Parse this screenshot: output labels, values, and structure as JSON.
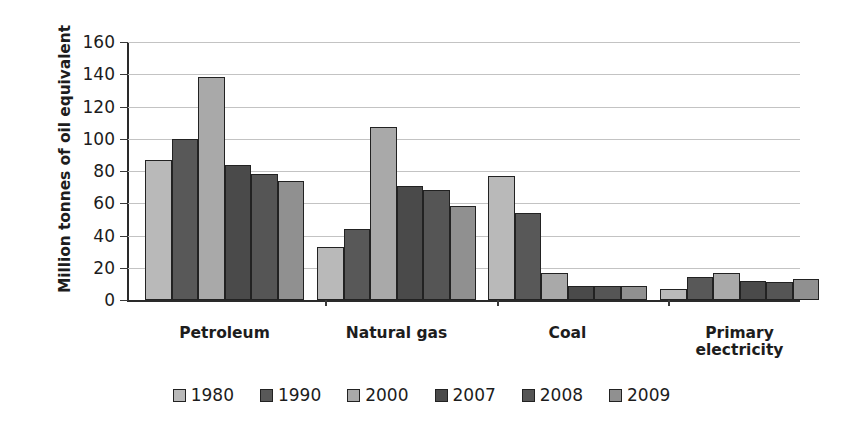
{
  "chart_data": {
    "type": "bar",
    "title": "",
    "xlabel": "",
    "ylabel": "Million tonnes of oil equivalent",
    "ylim": [
      0,
      160
    ],
    "yticks": [
      0,
      20,
      40,
      60,
      80,
      100,
      120,
      140,
      160
    ],
    "ytick_labels": [
      "0",
      "20",
      "40",
      "60",
      "80",
      "100",
      "120",
      "140",
      "160"
    ],
    "grid": true,
    "legend_position": "bottom",
    "categories": [
      "Petroleum",
      "Natural gas",
      "Coal",
      "Primary\nelectricity"
    ],
    "series": [
      {
        "name": "1980",
        "color": "#b9b9b9",
        "values": [
          87,
          33,
          77,
          7
        ]
      },
      {
        "name": "1990",
        "color": "#585858",
        "values": [
          100,
          44,
          54,
          14
        ]
      },
      {
        "name": "2000",
        "color": "#a9a9a9",
        "values": [
          138,
          107,
          17,
          17
        ]
      },
      {
        "name": "2007",
        "color": "#4a4a4a",
        "values": [
          84,
          71,
          9,
          12
        ]
      },
      {
        "name": "2008",
        "color": "#555555",
        "values": [
          78,
          68,
          9,
          11
        ]
      },
      {
        "name": "2009",
        "color": "#909090",
        "values": [
          74,
          58,
          9,
          13
        ]
      }
    ]
  },
  "colors": {
    "axis": "#2a2a2a",
    "grid": "#c3c3c3",
    "text": "#1c1c1c",
    "background": "#ffffff"
  }
}
